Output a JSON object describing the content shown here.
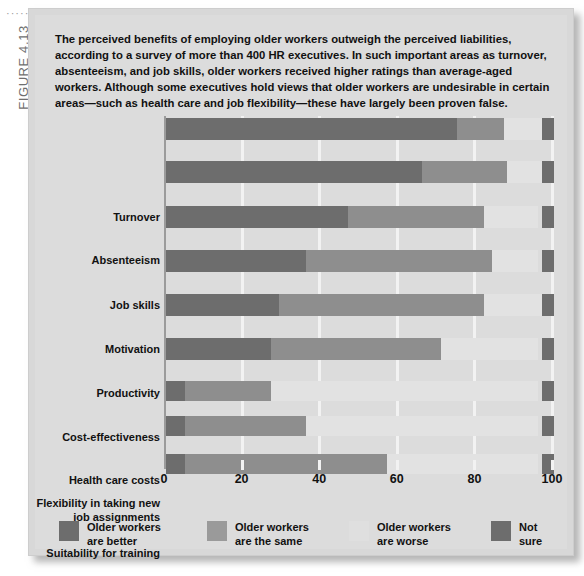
{
  "figure": {
    "label": "FIGURE 4.13",
    "dots": "·······"
  },
  "caption": "The perceived benefits of employing older workers outweigh the perceived liabilities, according to a survey of more than 400 HR executives. In such important areas as turnover, absenteeism, and job skills, older workers received higher ratings than average-aged workers. Although some executives hold views that older workers are undesirable in certain areas—such as health care and job flexibility—these have largely  been proven false.",
  "colors": {
    "better": "#6d6d6d",
    "same": "#8e8e8e",
    "worse": "#e2e2e2",
    "not_sure": "#6d6d6d",
    "panel_background": "#dcdcdc",
    "gridline": "#f2f2f2",
    "axis": "#9b9b9b",
    "text": "#111111"
  },
  "legend": {
    "position": "bottom",
    "items": [
      {
        "label": "Older workers\nare better",
        "swatch": "better"
      },
      {
        "label": "Older workers\nare the same",
        "swatch": "same"
      },
      {
        "label": "Older workers\nare worse",
        "swatch": "worse"
      },
      {
        "label": "Not sure",
        "swatch": "not_sure"
      }
    ]
  },
  "chart_data": {
    "type": "bar",
    "orientation": "horizontal",
    "stacked": true,
    "title": "",
    "xlabel": "",
    "ylabel": "",
    "xlim": [
      0,
      100
    ],
    "xticks": [
      0,
      20,
      40,
      60,
      80,
      100
    ],
    "xtick_labels": [
      "0",
      "20",
      "40",
      "60",
      "80",
      "100"
    ],
    "grid": true,
    "categories": [
      "Turnover",
      "Absenteeism",
      "Job skills",
      "Motivation",
      "Productivity",
      "Cost-effectiveness",
      "Health care costs",
      "Flexibility in taking new job assignments",
      "Suitability for training"
    ],
    "series": [
      {
        "name": "Older workers are better",
        "key": "better",
        "values": [
          75,
          66,
          47,
          36,
          29,
          27,
          5,
          5,
          5
        ]
      },
      {
        "name": "Older workers are the same",
        "key": "same",
        "values": [
          12,
          22,
          35,
          48,
          53,
          44,
          22,
          31,
          52
        ]
      },
      {
        "name": "Older workers are worse",
        "key": "worse",
        "values": [
          10,
          9,
          14,
          12,
          15,
          25,
          69,
          60,
          39
        ]
      },
      {
        "name": "Not sure",
        "key": "notsure",
        "values": [
          3,
          3,
          4,
          4,
          3,
          4,
          4,
          4,
          4
        ]
      }
    ],
    "not_sure_marker_start": 97,
    "not_sure_marker_width": 3
  }
}
